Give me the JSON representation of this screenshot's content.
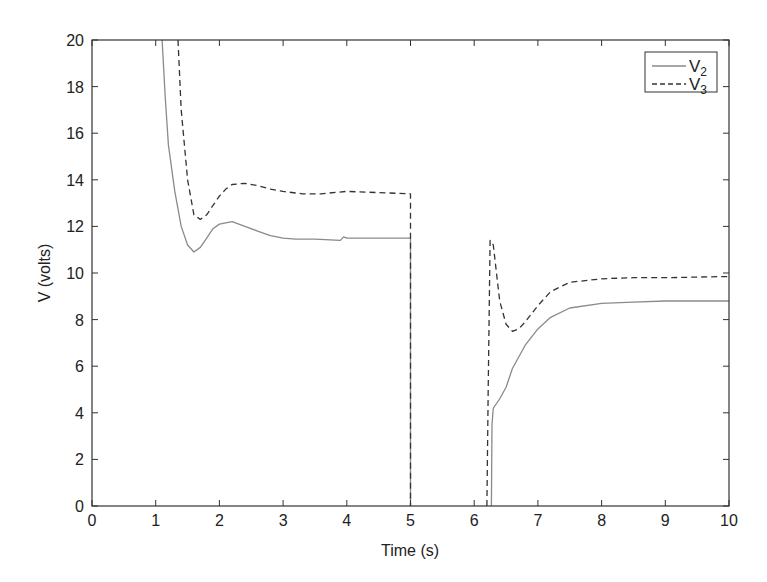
{
  "chart_data": {
    "type": "line",
    "title": "",
    "xlabel": "Time (s)",
    "ylabel": "V (volts)",
    "xlim": [
      0,
      10
    ],
    "ylim": [
      0,
      20
    ],
    "xticks": [
      0,
      1,
      2,
      3,
      4,
      5,
      6,
      7,
      8,
      9,
      10
    ],
    "yticks": [
      0,
      2,
      4,
      6,
      8,
      10,
      12,
      14,
      16,
      18,
      20
    ],
    "grid": false,
    "legend_position": "upper right",
    "series": [
      {
        "name": "V2",
        "label_main": "V",
        "label_sub": "2",
        "style": "solid",
        "color": "#8a8a8a",
        "x": [
          1.1,
          1.15,
          1.2,
          1.3,
          1.4,
          1.5,
          1.6,
          1.7,
          1.8,
          1.9,
          2.0,
          2.2,
          2.4,
          2.6,
          2.8,
          3.0,
          3.2,
          3.5,
          3.9,
          3.95,
          4.0,
          4.05,
          4.5,
          5.0,
          5.0,
          null,
          6.27,
          6.28,
          6.3,
          6.35,
          6.4,
          6.5,
          6.6,
          6.8,
          7.0,
          7.2,
          7.5,
          8.0,
          8.5,
          9.0,
          9.5,
          10.0
        ],
        "y": [
          20,
          17.5,
          15.5,
          13.5,
          12.0,
          11.2,
          10.9,
          11.1,
          11.5,
          11.9,
          12.1,
          12.2,
          12.0,
          11.8,
          11.6,
          11.5,
          11.45,
          11.45,
          11.4,
          11.55,
          11.5,
          11.5,
          11.5,
          11.5,
          0,
          null,
          0,
          3.5,
          4.2,
          4.4,
          4.6,
          5.1,
          5.9,
          6.9,
          7.6,
          8.1,
          8.5,
          8.7,
          8.75,
          8.8,
          8.8,
          8.8
        ]
      },
      {
        "name": "V3",
        "label_main": "V",
        "label_sub": "3",
        "style": "dashed",
        "color": "#333333",
        "x": [
          1.35,
          1.4,
          1.5,
          1.6,
          1.7,
          1.8,
          1.9,
          2.0,
          2.1,
          2.2,
          2.4,
          2.6,
          2.8,
          3.0,
          3.3,
          3.6,
          4.0,
          4.5,
          5.0,
          5.0,
          null,
          6.2,
          6.22,
          6.25,
          6.3,
          6.35,
          6.4,
          6.5,
          6.6,
          6.7,
          6.8,
          7.0,
          7.2,
          7.5,
          8.0,
          8.5,
          9.0,
          10.0
        ],
        "y": [
          20,
          17.0,
          14.0,
          12.5,
          12.3,
          12.5,
          12.9,
          13.3,
          13.6,
          13.8,
          13.85,
          13.75,
          13.6,
          13.5,
          13.4,
          13.4,
          13.5,
          13.45,
          13.4,
          0,
          null,
          0,
          5.0,
          11.4,
          11.2,
          10.0,
          8.8,
          7.8,
          7.5,
          7.6,
          7.9,
          8.6,
          9.2,
          9.6,
          9.75,
          9.8,
          9.8,
          9.85
        ]
      }
    ]
  },
  "axes": {
    "xlabel": "Time (s)",
    "ylabel": "V (volts)",
    "xtick_labels": [
      "0",
      "1",
      "2",
      "3",
      "4",
      "5",
      "6",
      "7",
      "8",
      "9",
      "10"
    ],
    "ytick_labels": [
      "0",
      "2",
      "4",
      "6",
      "8",
      "10",
      "12",
      "14",
      "16",
      "18",
      "20"
    ]
  },
  "legend": {
    "items": [
      {
        "main": "V",
        "sub": "2"
      },
      {
        "main": "V",
        "sub": "3"
      }
    ]
  }
}
